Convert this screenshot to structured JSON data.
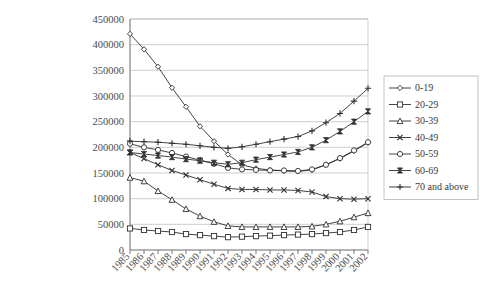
{
  "chart_data": {
    "type": "line",
    "title": "",
    "subtitle": "",
    "xlabel": "",
    "ylabel": "",
    "grid": true,
    "legend_position": "right",
    "ylim": [
      0,
      450000
    ],
    "ytick_step": 50000,
    "yticks": [
      "0",
      "50000",
      "100000",
      "150000",
      "200000",
      "250000",
      "300000",
      "350000",
      "400000",
      "450000"
    ],
    "categories": [
      "1985",
      "1986",
      "1987",
      "1988",
      "1989",
      "1990",
      "1991",
      "1992",
      "1993",
      "1994",
      "1995",
      "1996",
      "1997",
      "1998",
      "1999",
      "2000",
      "2001",
      "2002"
    ],
    "series": [
      {
        "name": "0-19",
        "marker": "diamond",
        "values": [
          421000,
          391000,
          357000,
          316000,
          279000,
          241000,
          212000,
          186000,
          166000,
          159000,
          156000,
          154000,
          153000,
          156000,
          166000,
          178000,
          193000,
          209000
        ]
      },
      {
        "name": "20-29",
        "marker": "square",
        "values": [
          42000,
          39000,
          37000,
          35000,
          31000,
          29000,
          27000,
          25000,
          26000,
          27000,
          28000,
          29000,
          30000,
          31000,
          33000,
          35000,
          39000,
          45000
        ]
      },
      {
        "name": "30-39",
        "marker": "triangle",
        "values": [
          141000,
          134000,
          115000,
          98000,
          80000,
          66000,
          55000,
          47000,
          45000,
          45000,
          45000,
          45000,
          45000,
          46000,
          50000,
          56000,
          64000,
          72000
        ]
      },
      {
        "name": "40-49",
        "marker": "cross",
        "values": [
          190000,
          178000,
          166000,
          155000,
          146000,
          137000,
          128000,
          120000,
          118000,
          118000,
          117000,
          117000,
          116000,
          113000,
          104000,
          100000,
          99000,
          100000
        ]
      },
      {
        "name": "50-59",
        "marker": "circle",
        "values": [
          207000,
          200000,
          195000,
          189000,
          182000,
          175000,
          168000,
          160000,
          157000,
          156000,
          155000,
          155000,
          154000,
          157000,
          166000,
          179000,
          194000,
          210000
        ]
      },
      {
        "name": "60-69",
        "marker": "bowtie",
        "values": [
          190000,
          187000,
          184000,
          181000,
          177000,
          174000,
          170000,
          167000,
          170000,
          176000,
          181000,
          186000,
          191000,
          200000,
          214000,
          231000,
          250000,
          270000
        ]
      },
      {
        "name": "70 and above",
        "marker": "plus",
        "values": [
          212000,
          211000,
          210000,
          208000,
          206000,
          203000,
          200000,
          198000,
          201000,
          206000,
          211000,
          216000,
          221000,
          232000,
          248000,
          266000,
          290000,
          315000
        ]
      }
    ]
  },
  "legend": {
    "items": [
      {
        "label": "0-19"
      },
      {
        "label": "20-29"
      },
      {
        "label": "30-39"
      },
      {
        "label": "40-49"
      },
      {
        "label": "50-59"
      },
      {
        "label": "60-69"
      },
      {
        "label": "70 and above"
      }
    ]
  },
  "colors": {
    "line": "#2f2f2f",
    "grid": "#b9b9b9",
    "axis": "#6a6a6a",
    "text": "#3a3a3a",
    "background": "#ffffff"
  }
}
